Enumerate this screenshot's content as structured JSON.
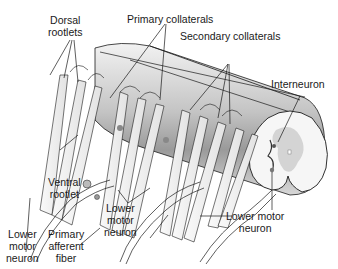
{
  "figure": {
    "colors": {
      "background": "#ffffff",
      "cord_light": "#e6e6e6",
      "cord_mid": "#bdbdbd",
      "cord_dark": "#8c8c8c",
      "line": "#1a1a1a",
      "rootlet_fill": "#f4f4f4"
    }
  },
  "labels": {
    "dorsal_rootlets": [
      "Dorsal",
      "rootlets"
    ],
    "primary_collaterals": "Primary collaterals",
    "secondary_collaterals": "Secondary collaterals",
    "interneuron": "Interneuron",
    "ventral_rootlet": [
      "Ventral",
      "rootlet"
    ],
    "lower_motor_neuron_left": [
      "Lower",
      "motor",
      "neuron"
    ],
    "primary_afferent_fiber": [
      "Primary",
      "afferent",
      "fiber"
    ],
    "lower_motor_neuron_center": [
      "Lower",
      "motor",
      "neuron"
    ],
    "lower_motor_neuron_right": [
      "Lower motor",
      "neuron"
    ]
  }
}
